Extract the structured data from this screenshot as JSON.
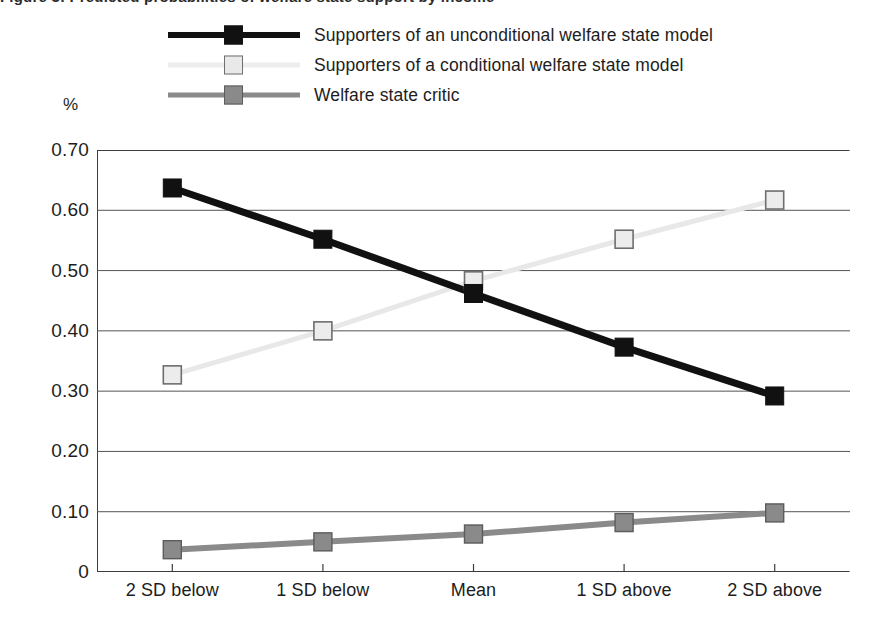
{
  "figure": {
    "title_cutoff": "Figure 3: Predicted probabilities of welfare state support by income",
    "percent_axis_caption": "%"
  },
  "legend": {
    "position": "top",
    "entries": [
      {
        "label": "Supporters of an unconditional welfare state model",
        "color": "#111111",
        "marker": "filled-square",
        "marker_name": "legend-marker-unconditional"
      },
      {
        "label": "Supporters of a conditional welfare state model",
        "color": "#e8e8e8",
        "marker": "outlined-square",
        "marker_name": "legend-marker-conditional"
      },
      {
        "label": "Welfare state critic",
        "color": "#8a8a8a",
        "marker": "filled-square",
        "marker_name": "legend-marker-critic"
      }
    ]
  },
  "chart_data": {
    "type": "line",
    "title": "",
    "xlabel": "",
    "ylabel": "%",
    "categories": [
      "2 SD below",
      "1 SD below",
      "Mean",
      "1 SD above",
      "2 SD above"
    ],
    "ylim": [
      0,
      0.7
    ],
    "yticks": [
      "0",
      "0.10",
      "0.20",
      "0.30",
      "0.40",
      "0.50",
      "0.60",
      "0.70"
    ],
    "ytick_values": [
      0,
      0.1,
      0.2,
      0.3,
      0.4,
      0.5,
      0.6,
      0.7
    ],
    "grid": true,
    "legend_position": "top",
    "series": [
      {
        "name": "Supporters of an unconditional welfare state model",
        "color": "#111111",
        "marker": "filled-square",
        "values": [
          0.637,
          0.552,
          0.462,
          0.373,
          0.292
        ]
      },
      {
        "name": "Supporters of a conditional welfare state model",
        "color": "#e8e8e8",
        "marker": "outlined-square",
        "values": [
          0.327,
          0.4,
          0.483,
          0.552,
          0.617
        ]
      },
      {
        "name": "Welfare state critic",
        "color": "#8a8a8a",
        "marker": "filled-square",
        "values": [
          0.037,
          0.05,
          0.063,
          0.082,
          0.098
        ]
      }
    ]
  },
  "colors": {
    "axis": "#3d3d3d",
    "grid": "#555555",
    "background": "#ffffff",
    "text": "#1d1d1d"
  }
}
